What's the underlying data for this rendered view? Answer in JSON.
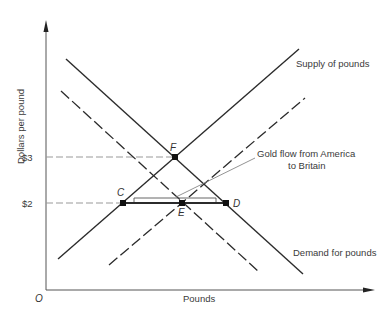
{
  "diagram": {
    "type": "supply-demand",
    "axes": {
      "x_label": "Pounds",
      "y_label": "Dollars per pound",
      "origin_label": "O",
      "y_ticks": [
        {
          "label": "$3",
          "y": 157
        },
        {
          "label": "$2",
          "y": 203
        }
      ]
    },
    "curves": {
      "supply": {
        "label": "Supply of pounds",
        "style": "solid"
      },
      "demand": {
        "label": "Demand for pounds",
        "style": "solid"
      },
      "supply_shifted": {
        "label": "",
        "style": "dashed"
      },
      "demand_shifted": {
        "label": "",
        "style": "dashed"
      }
    },
    "points": {
      "F": "F",
      "C": "C",
      "E": "E",
      "D": "D"
    },
    "annotation": {
      "line1": "Gold flow from America",
      "line2": "to Britain"
    },
    "colors": {
      "ink": "#2b2b2b",
      "guide": "#888888",
      "background": "#ffffff"
    }
  }
}
